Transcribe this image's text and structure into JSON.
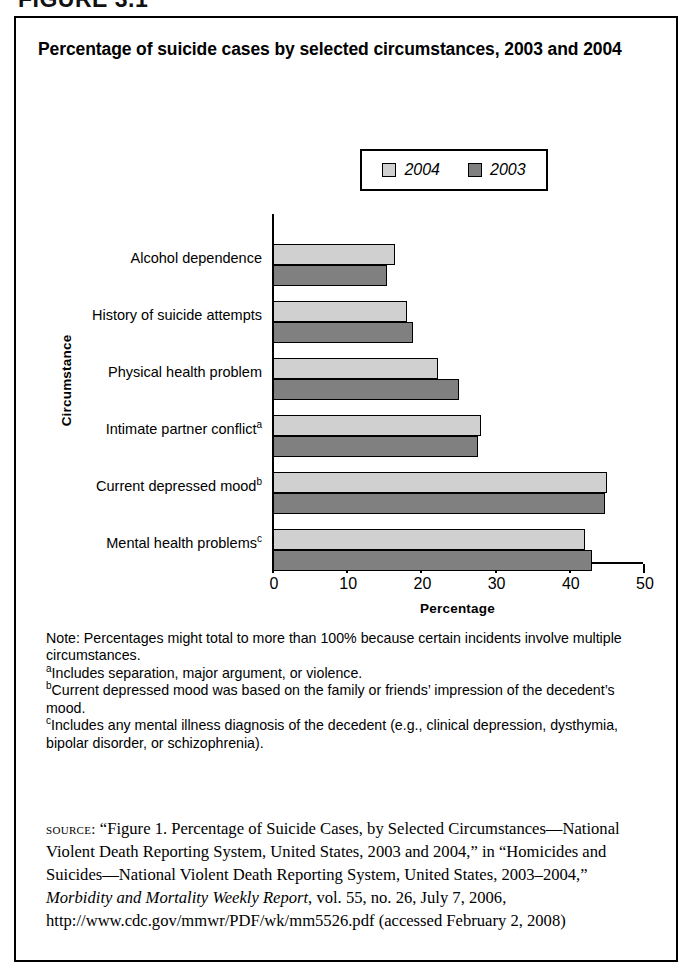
{
  "figure_number": "FIGURE 3.1",
  "title": "Percentage of suicide cases by selected circumstances, 2003 and 2004",
  "colors": {
    "series_2004": "#d0d0d0",
    "series_2003": "#808080",
    "outline": "#000000",
    "background": "#ffffff"
  },
  "chart_data": {
    "type": "bar",
    "orientation": "horizontal",
    "title": "Percentage of suicide cases by selected circumstances, 2003 and 2004",
    "xlabel": "Percentage",
    "ylabel": "Circumstance",
    "xlim": [
      0,
      50
    ],
    "xticks": [
      0,
      10,
      20,
      30,
      40,
      50
    ],
    "xtick_labels": [
      "0",
      "10",
      "20",
      "30",
      "40",
      "50"
    ],
    "grid": false,
    "legend_position": "top-right",
    "categories": [
      "Alcohol dependence",
      "History of suicide attempts",
      "Physical health problem",
      "Intimate partner conflict",
      "Current depressed mood",
      "Mental health problems"
    ],
    "category_footnote_markers": [
      "",
      "",
      "",
      "a",
      "b",
      "c"
    ],
    "series": [
      {
        "name": "2004",
        "color": "#d0d0d0",
        "values": [
          16.5,
          18.0,
          22.3,
          28.0,
          45.0,
          42.0
        ]
      },
      {
        "name": "2003",
        "color": "#808080",
        "values": [
          15.3,
          18.9,
          25.0,
          27.6,
          44.8,
          43.0
        ]
      }
    ]
  },
  "legend": {
    "items": [
      {
        "label": "2004",
        "color": "#d0d0d0"
      },
      {
        "label": "2003",
        "color": "#808080"
      }
    ]
  },
  "notes": {
    "note_line": "Note: Percentages might total to more than 100% because certain incidents involve multiple circumstances.",
    "footnote_a_marker": "a",
    "footnote_a": "Includes separation, major argument, or violence.",
    "footnote_b_marker": "b",
    "footnote_b": "Current depressed mood was based on the family or friends’ impression of the decedent’s mood.",
    "footnote_c_marker": "c",
    "footnote_c": "Includes any mental illness diagnosis of the decedent (e.g., clinical depression, dysthymia, bipolar disorder, or schizophrenia)."
  },
  "source": {
    "label": "source:",
    "text_part1": " “Figure 1. Percentage of Suicide Cases, by Selected Circumstances—National Violent Death Reporting System, United States, 2003 and 2004,” in “Homicides and Suicides—National Violent Death Reporting System, United States, 2003–2004,” ",
    "italic_title": "Morbidity and Mortality Weekly Report",
    "text_part2": ", vol. 55, no. 26, July 7, 2006, http://www.cdc.gov/mmwr/PDF/wk/mm5526.pdf (accessed February 2, 2008)"
  }
}
